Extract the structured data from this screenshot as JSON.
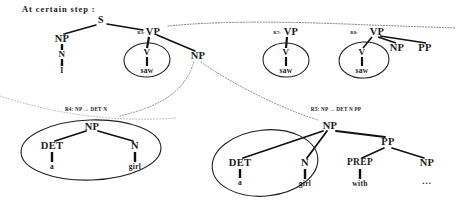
{
  "header": {
    "text": "At certain step :"
  },
  "colors": {
    "ink": "#1c1c1c",
    "line": "#111111",
    "ellipse": "#222222",
    "dotted": "#555555",
    "background": "#ffffff"
  },
  "diagram": {
    "type": "syntax-parse-tree-derivation",
    "main_tree": {
      "root": "S",
      "rule_label": "R3:",
      "nodes": [
        {
          "id": "s",
          "label": "S",
          "x": 101,
          "y": 20
        },
        {
          "id": "np1",
          "label": "NP",
          "x": 62,
          "y": 39
        },
        {
          "id": "n1",
          "label": "N",
          "x": 62,
          "y": 54
        },
        {
          "id": "i",
          "label": "I",
          "x": 62,
          "y": 70
        },
        {
          "id": "vp1",
          "label": "VP",
          "x": 150,
          "y": 32
        },
        {
          "id": "v1",
          "label": "V",
          "x": 147,
          "y": 52
        },
        {
          "id": "saw1",
          "label": "saw",
          "x": 147,
          "y": 70
        },
        {
          "id": "np2",
          "label": "NP",
          "x": 198,
          "y": 56
        }
      ]
    },
    "vp_alternatives": [
      {
        "rule_label": "R7:",
        "root": "VP",
        "x": 289,
        "y": 32,
        "children": [
          {
            "label": "V",
            "x": 286,
            "y": 52
          },
          {
            "label": "saw",
            "x": 286,
            "y": 70
          }
        ]
      },
      {
        "rule_label": "R8:",
        "root": "VP",
        "x": 376,
        "y": 32,
        "children": [
          {
            "label": "V",
            "x": 362,
            "y": 52
          },
          {
            "label": "saw",
            "x": 362,
            "y": 70
          },
          {
            "label": "NP",
            "x": 396,
            "y": 48
          },
          {
            "label": "PP",
            "x": 424,
            "y": 48
          }
        ]
      }
    ],
    "np_expansions": [
      {
        "rule_text": "R4: NP → DET N",
        "rule_x": 86,
        "rule_y": 110,
        "root": "NP",
        "nodes": [
          {
            "label": "NP",
            "x": 92,
            "y": 127
          },
          {
            "label": "DET",
            "x": 52,
            "y": 146
          },
          {
            "label": "a",
            "x": 52,
            "y": 166
          },
          {
            "label": "N",
            "x": 135,
            "y": 146
          },
          {
            "label": "girl",
            "x": 135,
            "y": 166
          }
        ]
      },
      {
        "rule_text": "R5: NP → DET N PP",
        "rule_x": 336,
        "rule_y": 110,
        "root": "NP",
        "nodes": [
          {
            "label": "NP",
            "x": 330,
            "y": 126
          },
          {
            "label": "DET",
            "x": 240,
            "y": 163
          },
          {
            "label": "a",
            "x": 240,
            "y": 182
          },
          {
            "label": "N",
            "x": 305,
            "y": 163
          },
          {
            "label": "girl",
            "x": 305,
            "y": 183
          },
          {
            "label": "PP",
            "x": 388,
            "y": 142
          },
          {
            "label": "PREP",
            "x": 360,
            "y": 163
          },
          {
            "label": "with",
            "x": 360,
            "y": 183
          },
          {
            "label": "NP",
            "x": 427,
            "y": 163
          },
          {
            "label": "...",
            "x": 427,
            "y": 181
          }
        ]
      }
    ],
    "annotations": {
      "ellipse_count": 5,
      "dotted_separator": true
    }
  }
}
